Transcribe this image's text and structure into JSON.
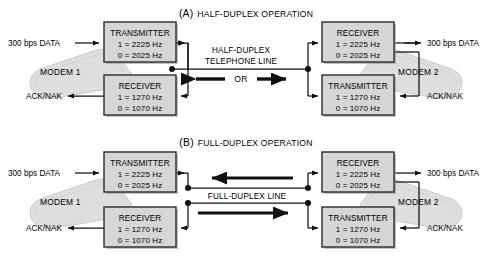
{
  "figure": {
    "title_a": "HALF-DUPLEX OPERATION",
    "title_a_tag": "(A)",
    "title_b": "FULL-DUPLEX OPERATION",
    "title_b_tag": "(B)",
    "colors": {
      "box_fill": "#d6d6d6",
      "box_border": "#2b2b2b",
      "modem_fill": "#d9d9d9",
      "line": "#1a1a1a",
      "background": "#ffffff",
      "shadow": "#8a8a8a"
    }
  },
  "section_a": {
    "title_tag": "(A)",
    "title": "HALF-DUPLEX OPERATION",
    "modem1_label": "MODEM 1",
    "modem2_label": "MODEM 2",
    "left_input_label": "300 bps DATA",
    "left_output_label": "ACK/NAK",
    "right_output_label": "300 bps DATA",
    "right_input_label": "ACK/NAK",
    "link_label_line1": "HALF-DUPLEX",
    "link_label_line2": "TELEPHONE LINE",
    "or_label": "OR",
    "transmitter_left": {
      "name": "TRANSMITTER",
      "mark": "1 = 2225 Hz",
      "space": "0 = 2025 Hz"
    },
    "receiver_left": {
      "name": "RECEIVER",
      "mark": "1 = 1270 Hz",
      "space": "0 = 1070 Hz"
    },
    "receiver_right": {
      "name": "RECEIVER",
      "mark": "1 = 2225 Hz",
      "space": "0 = 2025 Hz"
    },
    "transmitter_right": {
      "name": "TRANSMITTER",
      "mark": "1 = 1270 Hz",
      "space": "0 = 1070 Hz"
    }
  },
  "section_b": {
    "title_tag": "(B)",
    "title": "FULL-DUPLEX OPERATION",
    "modem1_label": "MODEM 1",
    "modem2_label": "MODEM 2",
    "left_input_label": "300 bps DATA",
    "left_output_label": "ACK/NAK",
    "right_output_label": "300 bps DATA",
    "right_input_label": "ACK/NAK",
    "link_label": "FULL-DUPLEX LINE",
    "transmitter_left": {
      "name": "TRANSMITTER",
      "mark": "1 = 2225 Hz",
      "space": "0 = 2025 Hz"
    },
    "receiver_left": {
      "name": "RECEIVER",
      "mark": "1 = 1270 Hz",
      "space": "0 = 1070 Hz"
    },
    "receiver_right": {
      "name": "RECEIVER",
      "mark": "1 = 2225 Hz",
      "space": "0 = 2025 Hz"
    },
    "transmitter_right": {
      "name": "TRANSMITTER",
      "mark": "1 = 1270 Hz",
      "space": "0 = 1070 Hz"
    }
  }
}
